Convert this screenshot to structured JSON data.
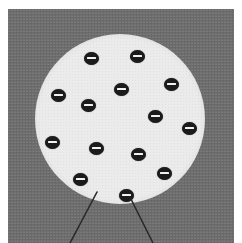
{
  "figure": {
    "plate": {
      "background_color": "#6e6e6e",
      "left": 8,
      "top": 9,
      "width": 226,
      "height": 234
    },
    "circle": {
      "name": "body-circle",
      "fill_color": "#ebebeb",
      "center_x": 120,
      "center_y": 119,
      "radius": 85
    },
    "ion_marker": {
      "symbol": "−",
      "semantic": "negative-charge-icon",
      "fill_color": "#1b1b1b",
      "bar_color": "#f2f2f2",
      "width": 15,
      "height": 13,
      "count": 14
    },
    "ions": [
      {
        "label": "−",
        "x": 91,
        "y": 58
      },
      {
        "label": "−",
        "x": 137,
        "y": 56
      },
      {
        "label": "−",
        "x": 58,
        "y": 95
      },
      {
        "label": "−",
        "x": 121,
        "y": 89
      },
      {
        "label": "−",
        "x": 171,
        "y": 84
      },
      {
        "label": "−",
        "x": 88,
        "y": 105
      },
      {
        "label": "−",
        "x": 155,
        "y": 116
      },
      {
        "label": "−",
        "x": 52,
        "y": 142
      },
      {
        "label": "−",
        "x": 189,
        "y": 128
      },
      {
        "label": "−",
        "x": 96,
        "y": 148
      },
      {
        "label": "−",
        "x": 138,
        "y": 154
      },
      {
        "label": "−",
        "x": 80,
        "y": 179
      },
      {
        "label": "−",
        "x": 164,
        "y": 173
      },
      {
        "label": "−",
        "x": 126,
        "y": 195
      }
    ],
    "leader_lines": [
      {
        "name": "leader-line-left",
        "x1": 97,
        "y1": 192,
        "x2": 70,
        "y2": 243,
        "color": "#2a2a2a"
      },
      {
        "name": "leader-line-right",
        "x1": 131,
        "y1": 199,
        "x2": 153,
        "y2": 243,
        "color": "#2a2a2a"
      }
    ]
  }
}
